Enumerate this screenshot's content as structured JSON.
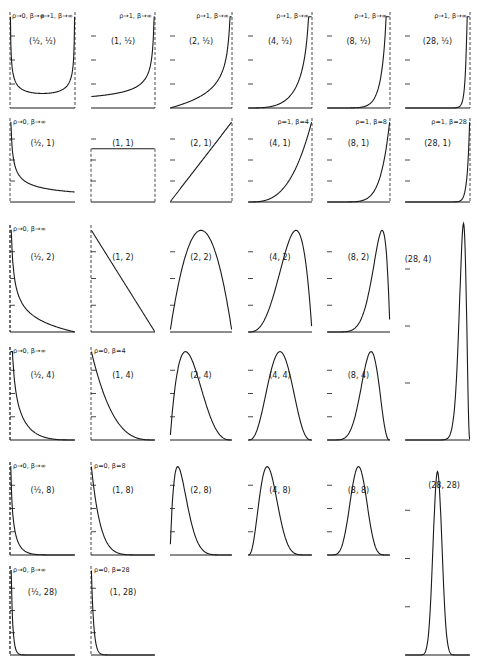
{
  "figure": {
    "ink_color": "#1a1a1a",
    "background": "#ffffff"
  },
  "chart_data": {
    "type": "line",
    "xlim": [
      0,
      1
    ],
    "grid": false,
    "legend": "none",
    "panels": [
      {
        "label": "(½, ½)",
        "p": 0.5,
        "q": 0.5,
        "annotation_left": "ρ→0, β→∞",
        "annotation_right": "ρ→1, β→∞",
        "shape": "U"
      },
      {
        "label": "(1, ½)",
        "p": 1,
        "q": 0.5,
        "annotation": "ρ→1, β→∞",
        "shape": "increasing-J"
      },
      {
        "label": "(2, ½)",
        "p": 2,
        "q": 0.5,
        "annotation": "ρ→1, β→∞",
        "shape": "increasing-J"
      },
      {
        "label": "(4, ½)",
        "p": 4,
        "q": 0.5,
        "annotation": "ρ→1, β→∞",
        "shape": "increasing-J"
      },
      {
        "label": "(8, ½)",
        "p": 8,
        "q": 0.5,
        "annotation": "ρ→1, β→∞",
        "shape": "increasing-J"
      },
      {
        "label": "(28, ½)",
        "p": 28,
        "q": 0.5,
        "annotation": "ρ→1, β→∞",
        "shape": "increasing-J"
      },
      {
        "label": "(½, 1)",
        "p": 0.5,
        "q": 1,
        "annotation": "ρ→0, β→∞",
        "shape": "decreasing-J"
      },
      {
        "label": "(1, 1)",
        "p": 1,
        "q": 1,
        "annotation": "",
        "shape": "uniform"
      },
      {
        "label": "(2, 1)",
        "p": 2,
        "q": 1,
        "annotation": "",
        "shape": "linear-increasing"
      },
      {
        "label": "(4, 1)",
        "p": 4,
        "q": 1,
        "annotation": "ρ=1, β=4",
        "shape": "increasing"
      },
      {
        "label": "(8, 1)",
        "p": 8,
        "q": 1,
        "annotation": "ρ=1, β=8",
        "shape": "increasing"
      },
      {
        "label": "(28, 1)",
        "p": 28,
        "q": 1,
        "annotation": "ρ=1, β=28",
        "shape": "increasing"
      },
      {
        "label": "(½, 2)",
        "p": 0.5,
        "q": 2,
        "annotation": "ρ→0, β→∞",
        "shape": "decreasing-J"
      },
      {
        "label": "(1, 2)",
        "p": 1,
        "q": 2,
        "annotation": "",
        "shape": "linear-decreasing"
      },
      {
        "label": "(2, 2)",
        "p": 2,
        "q": 2,
        "annotation": "",
        "shape": "symmetric-arch"
      },
      {
        "label": "(4, 2)",
        "p": 4,
        "q": 2,
        "annotation": "",
        "shape": "unimodal-left-skew"
      },
      {
        "label": "(8, 2)",
        "p": 8,
        "q": 2,
        "annotation": "",
        "shape": "unimodal-left-skew"
      },
      {
        "label": "(28, 4)",
        "p": 28,
        "q": 4,
        "annotation": "",
        "shape": "sharp-peak-right"
      },
      {
        "label": "(½, 4)",
        "p": 0.5,
        "q": 4,
        "annotation": "ρ→0, β→∞",
        "shape": "decreasing-J"
      },
      {
        "label": "(1, 4)",
        "p": 1,
        "q": 4,
        "annotation": "ρ=0, β=4",
        "shape": "decreasing"
      },
      {
        "label": "(2, 4)",
        "p": 2,
        "q": 4,
        "annotation": "",
        "shape": "unimodal-right-skew"
      },
      {
        "label": "(4, 4)",
        "p": 4,
        "q": 4,
        "annotation": "",
        "shape": "symmetric-bell"
      },
      {
        "label": "(8, 4)",
        "p": 8,
        "q": 4,
        "annotation": "",
        "shape": "unimodal-left-skew"
      },
      {
        "label": "(½, 8)",
        "p": 0.5,
        "q": 8,
        "annotation": "ρ→0, β→∞",
        "shape": "decreasing-J"
      },
      {
        "label": "(1, 8)",
        "p": 1,
        "q": 8,
        "annotation": "ρ=0, β=8",
        "shape": "decreasing"
      },
      {
        "label": "(2, 8)",
        "p": 2,
        "q": 8,
        "annotation": "",
        "shape": "unimodal-right-skew"
      },
      {
        "label": "(4, 8)",
        "p": 4,
        "q": 8,
        "annotation": "",
        "shape": "unimodal-right-skew"
      },
      {
        "label": "(8, 8)",
        "p": 8,
        "q": 8,
        "annotation": "",
        "shape": "symmetric-bell"
      },
      {
        "label": "(28, 28)",
        "p": 28,
        "q": 28,
        "annotation": "",
        "shape": "narrow-symmetric-peak"
      },
      {
        "label": "(½, 28)",
        "p": 0.5,
        "q": 28,
        "annotation": "ρ→0, β→∞",
        "shape": "decreasing-J"
      },
      {
        "label": "(1, 28)",
        "p": 1,
        "q": 28,
        "annotation": "ρ=0, β=28",
        "shape": "decreasing"
      }
    ]
  }
}
